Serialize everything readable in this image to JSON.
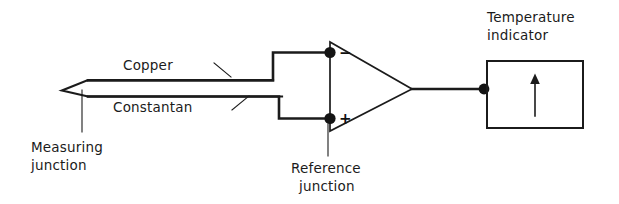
{
  "diagram": {
    "labels": {
      "copper": "Copper",
      "constantan": "Constantan",
      "measuring_junction_line1": "Measuring",
      "measuring_junction_line2": "junction",
      "reference_junction_line1": "Reference",
      "reference_junction_line2": "junction",
      "temperature_indicator_line1": "Temperature",
      "temperature_indicator_line2": "indicator"
    },
    "amplifier": {
      "inverting_sign": "−",
      "noninverting_sign": "+"
    },
    "colors": {
      "ink": "#1b1b1b",
      "background": "#ffffff",
      "node": "#141414"
    }
  }
}
